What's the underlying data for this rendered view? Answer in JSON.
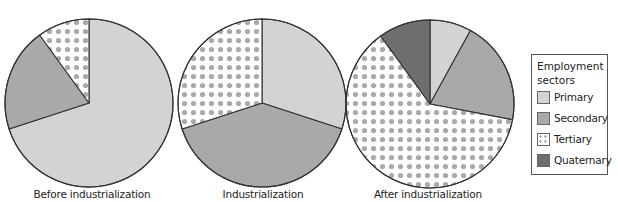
{
  "chart_data": [
    {
      "type": "pie",
      "title": "Before industrialization",
      "categories": [
        "Primary",
        "Secondary",
        "Tertiary",
        "Quaternary"
      ],
      "values": [
        70,
        20,
        10,
        0
      ],
      "unit": "%",
      "start_angle": "12 o'clock, clockwise"
    },
    {
      "type": "pie",
      "title": "Industrialization",
      "categories": [
        "Primary",
        "Secondary",
        "Tertiary",
        "Quaternary"
      ],
      "values": [
        30,
        40,
        30,
        0
      ],
      "unit": "%",
      "start_angle": "12 o'clock, clockwise"
    },
    {
      "type": "pie",
      "title": "After industrialization",
      "categories": [
        "Primary",
        "Secondary",
        "Tertiary",
        "Quaternary"
      ],
      "values": [
        8,
        20,
        62,
        10
      ],
      "unit": "%",
      "start_angle": "12 o'clock, clockwise"
    }
  ],
  "labels": {
    "pie1": "Before industrialization",
    "pie2": "Industrialization",
    "pie3": "After industrialization"
  },
  "legend": {
    "title_line1": "Employment",
    "title_line2": "sectors",
    "items": [
      {
        "label": "Primary",
        "color": "#d3d3d3",
        "pattern": "solid"
      },
      {
        "label": "Secondary",
        "color": "#a9a9a9",
        "pattern": "solid"
      },
      {
        "label": "Tertiary",
        "color": "#aaaaaa",
        "pattern": "dots"
      },
      {
        "label": "Quaternary",
        "color": "#6e6e6e",
        "pattern": "solid"
      }
    ],
    "position": "right"
  },
  "colors": {
    "primary": "#d3d3d3",
    "secondary": "#a9a9a9",
    "tertiary_dot": "#aaaaaa",
    "tertiary_bg": "#ffffff",
    "quaternary": "#6e6e6e",
    "outline": "#333333"
  }
}
